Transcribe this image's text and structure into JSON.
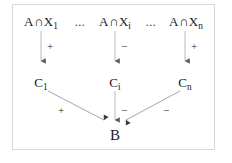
{
  "figure": {
    "type": "causal-influence-diagram",
    "background_color": "#ffffff",
    "border_color": "#d8d8d8",
    "text_color": "#1b1b1b",
    "edge_color": "#8c8c8c"
  },
  "top_row": {
    "nodes": [
      {
        "id": "top-1",
        "base": "A",
        "operator": "∩",
        "variable": "X",
        "subscript": "1",
        "text": "A ∩ X₁"
      },
      {
        "id": "top-i",
        "base": "A",
        "operator": "∩",
        "variable": "X",
        "subscript": "i",
        "text": "A ∩ Xᵢ"
      },
      {
        "id": "top-n",
        "base": "A",
        "operator": "∩",
        "variable": "X",
        "subscript": "n",
        "text": "A ∩ Xₙ"
      }
    ],
    "ellipses": [
      "...",
      "..."
    ]
  },
  "mid_row": {
    "nodes": [
      {
        "id": "c-1",
        "base": "C",
        "subscript": "1",
        "text": "C₁"
      },
      {
        "id": "c-i",
        "base": "C",
        "subscript": "i",
        "text": "Cᵢ"
      },
      {
        "id": "c-n",
        "base": "C",
        "subscript": "n",
        "text": "Cₙ"
      }
    ]
  },
  "bottom_row": {
    "node": {
      "id": "b",
      "text": "B"
    }
  },
  "edges": {
    "top_to_mid": [
      {
        "id": "edge-top1-c1",
        "from": "top-1",
        "to": "c-1",
        "sign": "+"
      },
      {
        "id": "edge-topi-ci",
        "from": "top-i",
        "to": "c-i",
        "sign": "−"
      },
      {
        "id": "edge-topn-cn",
        "from": "top-n",
        "to": "c-n",
        "sign": "+"
      }
    ],
    "mid_to_bottom": [
      {
        "id": "edge-c1-b",
        "from": "c-1",
        "to": "b",
        "sign": "+"
      },
      {
        "id": "edge-ci-b",
        "from": "c-i",
        "to": "b",
        "sign": "−"
      },
      {
        "id": "edge-cn-b",
        "from": "c-n",
        "to": "b",
        "sign": "−"
      }
    ]
  }
}
